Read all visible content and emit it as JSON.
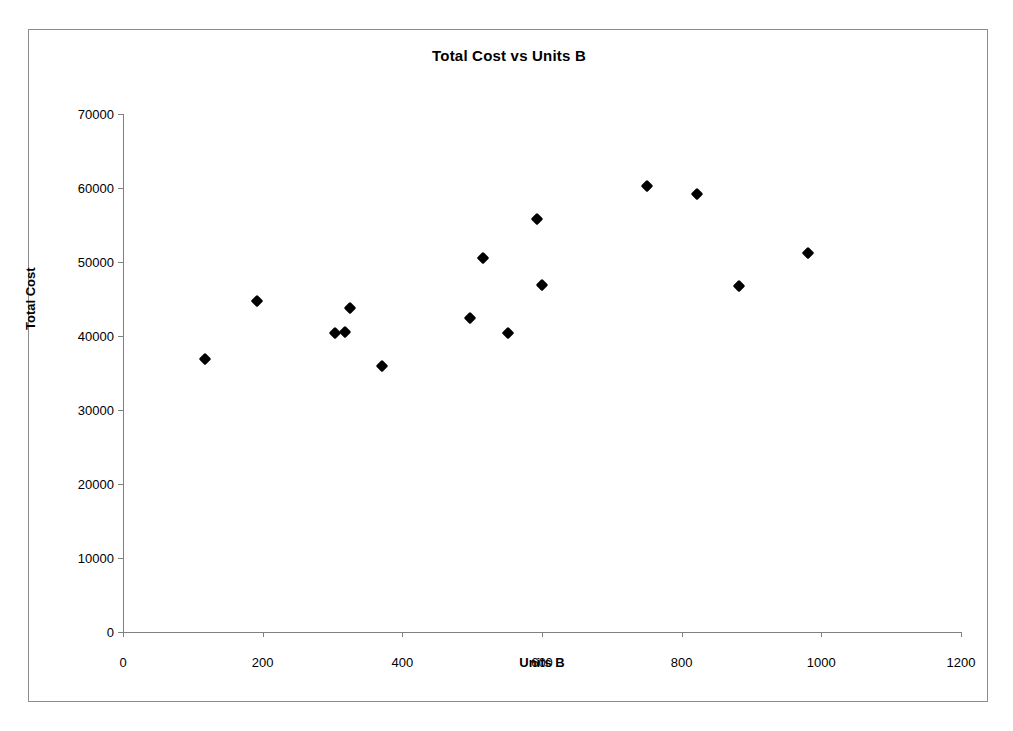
{
  "chart_data": {
    "type": "scatter",
    "title": "Total Cost vs Units B",
    "xlabel": "Units B",
    "ylabel": "Total Cost",
    "xlim": [
      0,
      1200
    ],
    "ylim": [
      0,
      70000
    ],
    "xticks": [
      0,
      200,
      400,
      600,
      800,
      1000,
      1200
    ],
    "yticks": [
      0,
      10000,
      20000,
      30000,
      40000,
      50000,
      60000,
      70000
    ],
    "xtick_labels": [
      "0",
      "200",
      "400",
      "600",
      "800",
      "1000",
      "1200"
    ],
    "ytick_labels": [
      "0",
      "10000",
      "20000",
      "30000",
      "40000",
      "50000",
      "60000",
      "70000"
    ],
    "grid": false,
    "legend": false,
    "marker": "diamond",
    "marker_color": "#000000",
    "series": [
      {
        "name": "Total Cost",
        "points": [
          {
            "x": 117,
            "y": 36900
          },
          {
            "x": 192,
            "y": 44700
          },
          {
            "x": 304,
            "y": 40400
          },
          {
            "x": 318,
            "y": 40600
          },
          {
            "x": 325,
            "y": 43800
          },
          {
            "x": 371,
            "y": 35900
          },
          {
            "x": 497,
            "y": 42500
          },
          {
            "x": 516,
            "y": 50500
          },
          {
            "x": 551,
            "y": 40400
          },
          {
            "x": 593,
            "y": 55800
          },
          {
            "x": 600,
            "y": 46900
          },
          {
            "x": 750,
            "y": 60300
          },
          {
            "x": 822,
            "y": 59200
          },
          {
            "x": 882,
            "y": 46700
          },
          {
            "x": 981,
            "y": 51200
          }
        ]
      }
    ]
  },
  "colors": {
    "frame_border": "#8c8c8c",
    "axis": "#808080",
    "marker": "#000000",
    "text": "#000000",
    "background": "#ffffff"
  }
}
